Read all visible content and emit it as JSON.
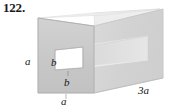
{
  "figure": {
    "number_label": "122.",
    "shape": "rectangular-prism-with-square-through-hole",
    "labels": {
      "a_left": "a",
      "b_upper": "b",
      "b_lower": "b",
      "a_bottom": "a",
      "length_3a": "3a"
    },
    "colors": {
      "background": "#ffffff",
      "front_face": "#c9c9c9",
      "right_face": "#d6d6d6",
      "top_face": "#efefef",
      "hole_top_inner": "#f2f2f2",
      "hole_side_inner": "#e0e0e0",
      "hole_bottom_inner": "#f7f7f7",
      "far_end_face": "#e9e9e9",
      "outline": "#b5b5b5",
      "text": "#161616"
    }
  }
}
